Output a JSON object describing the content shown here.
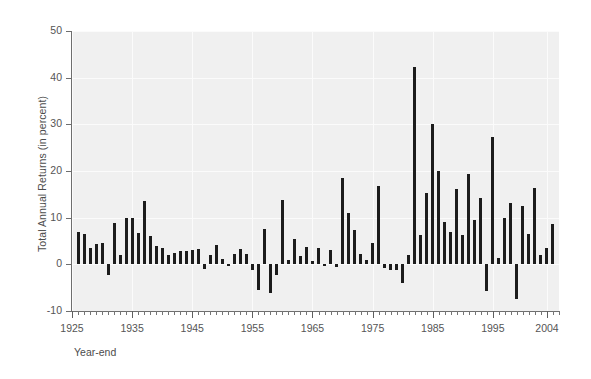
{
  "chart_data": {
    "type": "bar",
    "title": "",
    "subtitle": "",
    "xlabel": "Year-end",
    "ylabel": "Total Annual Returns (in percent)",
    "ylim": [
      -10,
      50
    ],
    "xlim": [
      1925,
      2006
    ],
    "ytick_labels": [
      "-10",
      "0",
      "10",
      "20",
      "30",
      "40",
      "50"
    ],
    "ytick_values": [
      -10,
      0,
      10,
      20,
      30,
      40,
      50
    ],
    "xtick_labels": [
      "1925",
      "1935",
      "1945",
      "1955",
      "1965",
      "1975",
      "1985",
      "1995",
      "2004"
    ],
    "xtick_values": [
      1925,
      1935,
      1945,
      1955,
      1965,
      1975,
      1985,
      1995,
      2004
    ],
    "grid": true,
    "grid_color": "#fbfbfb",
    "plot_background": "#f0f0f0",
    "bar_color": "#1c1c1c",
    "legend": null,
    "annotations": [],
    "categories": [
      1926,
      1927,
      1928,
      1929,
      1930,
      1931,
      1932,
      1933,
      1934,
      1935,
      1936,
      1937,
      1938,
      1939,
      1940,
      1941,
      1942,
      1943,
      1944,
      1945,
      1946,
      1947,
      1948,
      1949,
      1950,
      1951,
      1952,
      1953,
      1954,
      1955,
      1956,
      1957,
      1958,
      1959,
      1960,
      1961,
      1962,
      1963,
      1964,
      1965,
      1966,
      1967,
      1968,
      1969,
      1970,
      1971,
      1972,
      1973,
      1974,
      1975,
      1976,
      1977,
      1978,
      1979,
      1980,
      1981,
      1982,
      1983,
      1984,
      1985,
      1986,
      1987,
      1988,
      1989,
      1990,
      1991,
      1992,
      1993,
      1994,
      1995,
      1996,
      1997,
      1998,
      1999,
      2000,
      2001,
      2002,
      2003,
      2004,
      2005
    ],
    "values": [
      7.0,
      6.5,
      3.4,
      4.3,
      4.5,
      -2.3,
      8.8,
      1.9,
      10.0,
      9.9,
      6.7,
      13.5,
      6.1,
      4.0,
      3.4,
      2.0,
      2.5,
      2.8,
      2.8,
      3.1,
      3.2,
      -0.9,
      1.9,
      4.1,
      1.1,
      -0.3,
      2.3,
      3.2,
      2.2,
      -1.3,
      -5.6,
      7.5,
      -6.1,
      -2.3,
      13.8,
      0.9,
      5.5,
      1.7,
      3.7,
      0.7,
      3.6,
      -0.1,
      3.1,
      -0.5,
      18.4,
      11.0,
      7.3,
      2.3,
      1.0,
      4.5,
      16.8,
      -0.7,
      -1.2,
      -1.2,
      -4.0,
      1.9,
      42.3,
      6.3,
      15.2,
      30.1,
      19.9,
      9.0,
      7.0,
      16.2,
      6.2,
      19.3,
      9.4,
      14.2,
      -5.8,
      27.2,
      1.4,
      10.0,
      13.1,
      -7.5,
      12.6,
      6.4,
      16.3,
      2.1,
      3.5,
      8.6
    ]
  }
}
